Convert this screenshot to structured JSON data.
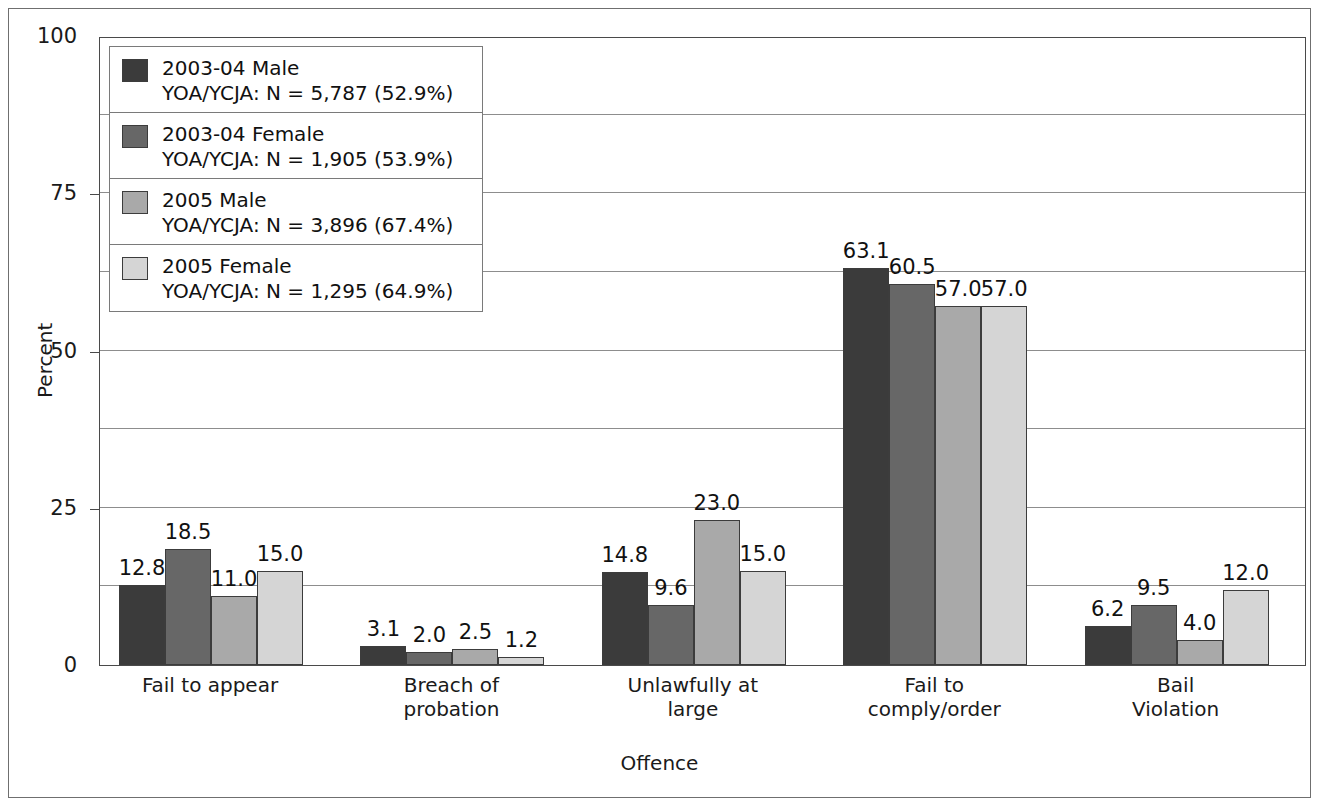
{
  "chart_data": {
    "type": "bar",
    "title": "",
    "xlabel": "Offence",
    "ylabel": "Percent",
    "ylim": [
      0,
      100
    ],
    "yticks": [
      "0",
      "25",
      "50",
      "75",
      "100"
    ],
    "ytick_values": [
      0,
      25,
      50,
      75,
      100
    ],
    "gridlines": [
      12.5,
      25,
      37.5,
      50,
      62.5,
      75,
      87.5
    ],
    "grid": true,
    "legend_position": "upper-left inside plot",
    "categories": [
      {
        "line1": "Fail to appear",
        "line2": ""
      },
      {
        "line1": "Breach of",
        "line2": "probation"
      },
      {
        "line1": "Unlawfully at",
        "line2": "large"
      },
      {
        "line1": "Fail to",
        "line2": "comply/order"
      },
      {
        "line1": "Bail",
        "line2": "Violation"
      }
    ],
    "category_labels": [
      "Fail to appear",
      "Breach of probation",
      "Unlawfully at large",
      "Fail to comply/order",
      "Bail Violation"
    ],
    "series": [
      {
        "name": "2003-04 Male",
        "sublabel": "YOA/YCJA: N = 5,787 (52.9%)",
        "color": "#3b3b3b",
        "values": [
          12.8,
          3.1,
          14.8,
          63.1,
          6.2
        ],
        "labels": [
          "12.8",
          "3.1",
          "14.8",
          "63.1",
          "6.2"
        ]
      },
      {
        "name": "2003-04 Female",
        "sublabel": "YOA/YCJA: N = 1,905 (53.9%)",
        "color": "#676767",
        "values": [
          18.5,
          2.0,
          9.6,
          60.5,
          9.5
        ],
        "labels": [
          "18.5",
          "2.0",
          "9.6",
          "60.5",
          "9.5"
        ]
      },
      {
        "name": "2005 Male",
        "sublabel": "YOA/YCJA: N = 3,896 (67.4%)",
        "color": "#a9a9a9",
        "values": [
          11.0,
          2.5,
          23.0,
          57.0,
          4.0
        ],
        "labels": [
          "11.0",
          "2.5",
          "23.0",
          "57.0",
          "4.0"
        ]
      },
      {
        "name": "2005 Female",
        "sublabel": "YOA/YCJA: N = 1,295 (64.9%)",
        "color": "#d5d5d5",
        "values": [
          15.0,
          1.2,
          15.0,
          57.0,
          12.0
        ],
        "labels": [
          "15.0",
          "1.2",
          "15.0",
          "57.0",
          "12.0"
        ]
      }
    ]
  },
  "legend": {
    "entries": [
      {
        "name": "2003-04 Male",
        "sublabel": "YOA/YCJA: N = 5,787 (52.9%)",
        "color": "#3b3b3b"
      },
      {
        "name": "2003-04 Female",
        "sublabel": "YOA/YCJA: N = 1,905 (53.9%)",
        "color": "#676767"
      },
      {
        "name": "2005 Male",
        "sublabel": "YOA/YCJA: N = 3,896 (67.4%)",
        "color": "#a9a9a9"
      },
      {
        "name": "2005 Female",
        "sublabel": "YOA/YCJA: N = 1,295 (64.9%)",
        "color": "#d5d5d5"
      }
    ]
  },
  "axes": {
    "y_title": "Percent",
    "x_title": "Offence",
    "y_ticks": [
      "100",
      "75",
      "50",
      "25",
      "0"
    ]
  }
}
